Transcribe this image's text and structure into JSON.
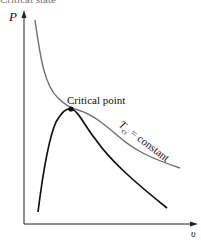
{
  "header": {
    "caption": "Critical state"
  },
  "axes": {
    "y_label": "P",
    "x_label": "υ"
  },
  "annotations": {
    "critical_point": "Critical point",
    "isotherm_T": "T",
    "isotherm_sub": "cr",
    "isotherm_rest": " = constant"
  },
  "colors": {
    "axis": "#222222",
    "isotherm": "#6e6e6e",
    "dome": "#111111"
  }
}
